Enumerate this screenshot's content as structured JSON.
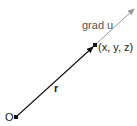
{
  "diagram": {
    "origin_label": "O",
    "point_label": "(x, y, z)",
    "vector_r_label": "r",
    "gradient_label": "grad u",
    "colors": {
      "position_vector": "#111111",
      "gradient_vector": "#999999",
      "points": "#111111"
    }
  }
}
